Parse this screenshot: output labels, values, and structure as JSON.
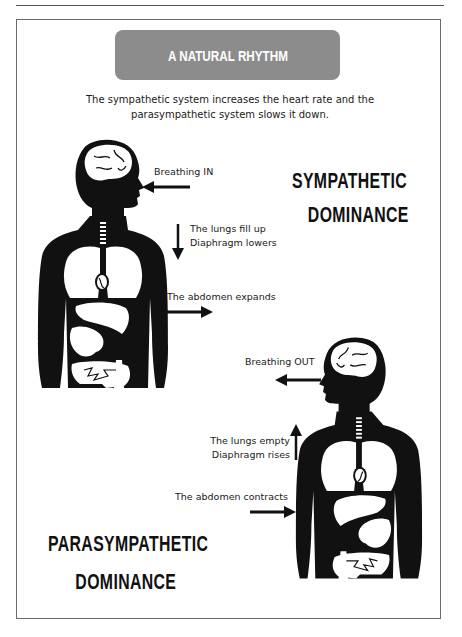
{
  "title": "A NATURAL RHYTHM",
  "intro": {
    "line1": "The sympathetic system increases the heart rate and the",
    "line2": "parasympathetic system slows it down."
  },
  "sympathetic": {
    "heading_line1": "SYMPATHETIC",
    "heading_line2": "DOMINANCE",
    "breathing_label": "Breathing IN",
    "lungs_line1": "The lungs fill up",
    "lungs_line2": "Diaphragm lowers",
    "abdomen_label": "The abdomen expands",
    "icons": {
      "breathing_arrow": "arrow-left-icon",
      "lungs_arrow": "arrow-down-icon",
      "abdomen_arrow": "arrow-right-icon",
      "figure": "human-body-anatomy-icon"
    }
  },
  "parasympathetic": {
    "heading_line1": "PARASYMPATHETIC",
    "heading_line2": "DOMINANCE",
    "breathing_label": "Breathing OUT",
    "lungs_line1": "The lungs empty",
    "lungs_line2": "Diaphragm rises",
    "abdomen_label": "The abdomen contracts",
    "icons": {
      "breathing_arrow": "arrow-left-icon",
      "lungs_arrow": "arrow-up-icon",
      "abdomen_arrow": "arrow-right-icon",
      "figure": "human-body-anatomy-icon"
    }
  },
  "colors": {
    "banner": "#8c8c8c",
    "banner_text": "#ffffff",
    "figure": "#111111",
    "organs": "#ffffff",
    "frame": "#6a6a6a"
  }
}
